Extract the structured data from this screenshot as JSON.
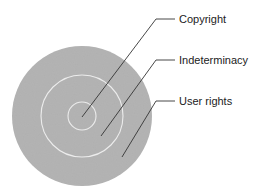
{
  "diagram": {
    "type": "concentric-circles",
    "center": {
      "x": 82,
      "y": 116
    },
    "colors": {
      "fill": "#b4b4b4",
      "ring_stroke": "#ececec",
      "leader": "#333333",
      "text": "#222222",
      "background": "#ffffff"
    },
    "circles": [
      {
        "name": "outer",
        "radius": 70
      },
      {
        "name": "middle",
        "radius": 41
      },
      {
        "name": "inner",
        "radius": 14
      }
    ],
    "labels": [
      {
        "text": "Copyright",
        "target": "inner",
        "leader": {
          "start": [
            82,
            117
          ],
          "elbow": [
            156,
            19
          ],
          "end": [
            175,
            19
          ]
        },
        "pos": {
          "x": 179,
          "y": 13
        }
      },
      {
        "text": "Indeterminacy",
        "target": "middle",
        "leader": {
          "start": [
            101,
            136
          ],
          "elbow": [
            156,
            60
          ],
          "end": [
            175,
            60
          ]
        },
        "pos": {
          "x": 179,
          "y": 54
        }
      },
      {
        "text": "User rights",
        "target": "outer",
        "leader": {
          "start": [
            122,
            157
          ],
          "elbow": [
            156,
            101
          ],
          "end": [
            175,
            101
          ]
        },
        "pos": {
          "x": 179,
          "y": 95
        }
      }
    ]
  }
}
